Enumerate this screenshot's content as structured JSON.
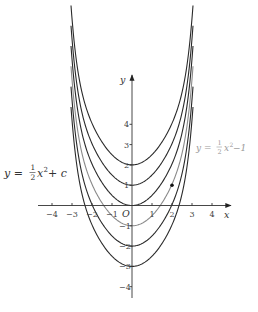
{
  "figure": {
    "type": "family-of-parabolas",
    "origin_px": [
      132,
      205.5
    ],
    "unit_px": [
      20,
      20.3
    ],
    "x_axis": {
      "label": "x",
      "range": [
        -4.7,
        4.9
      ],
      "ticks": [
        {
          "value": -4,
          "label": "−4"
        },
        {
          "value": -3,
          "label": "−3"
        },
        {
          "value": -2,
          "label": "−2"
        },
        {
          "value": -1,
          "label": "−1"
        },
        {
          "value": 1,
          "label": "1"
        },
        {
          "value": 2,
          "label": "2"
        },
        {
          "value": 3,
          "label": "3"
        },
        {
          "value": 4,
          "label": "4"
        }
      ]
    },
    "y_axis": {
      "label": "y",
      "range": [
        -4.5,
        6.4
      ],
      "ticks": [
        {
          "value": 4,
          "label": "4"
        },
        {
          "value": 3,
          "label": "3"
        },
        {
          "value": 2,
          "label": "2"
        },
        {
          "value": 1,
          "label": "1"
        },
        {
          "value": -1,
          "label": "−1"
        },
        {
          "value": -2,
          "label": "−2"
        },
        {
          "value": -3,
          "label": "−3"
        },
        {
          "value": -4,
          "label": "−4"
        }
      ]
    },
    "origin_label": "O",
    "curves": [
      {
        "c": 2,
        "highlight": false
      },
      {
        "c": 1,
        "highlight": false
      },
      {
        "c": 0,
        "highlight": false
      },
      {
        "c": -1,
        "highlight": true
      },
      {
        "c": -2,
        "highlight": false
      },
      {
        "c": -3,
        "highlight": false
      }
    ],
    "point": {
      "x": 2,
      "y": 1
    },
    "general_equation": {
      "lhs": "y = ",
      "coef_num": "1",
      "coef_den": "2",
      "rest": "x",
      "exp": "2",
      "tail": " + c"
    },
    "particular_equation": {
      "lhs": "y = ",
      "coef_num": "1",
      "coef_den": "2",
      "rest": "x",
      "exp": "2",
      "tail": " −1"
    },
    "colors": {
      "curve": "#2a2a2a",
      "highlight_curve": "#8a8a8a",
      "highlight_label": "#9a9a9a"
    }
  }
}
